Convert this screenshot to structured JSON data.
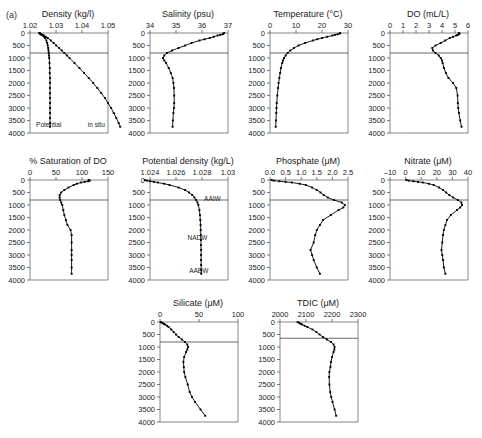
{
  "figure": {
    "panel_letter": "(a)",
    "depth_axis": {
      "label": "Depth (m)",
      "ticks": [
        0,
        500,
        1000,
        1500,
        2000,
        2500,
        3000,
        3500,
        4000
      ],
      "range": [
        0,
        4000
      ],
      "inverted": true
    },
    "reference_line_depth": 800
  },
  "chart_data": [
    {
      "type": "line",
      "title": "Density (kg/l)",
      "xlabel": "Density (kg/l)",
      "ylabel": "Depth (m)",
      "xlim": [
        1.02,
        1.05
      ],
      "ylim": [
        0,
        4000
      ],
      "xticks": [
        1.02,
        1.03,
        1.04,
        1.05
      ],
      "xticklabels": [
        "1.02",
        "1.03",
        "1.04",
        "1.05"
      ],
      "yticks": [
        0,
        500,
        1000,
        1500,
        2000,
        2500,
        3000,
        3500,
        4000
      ],
      "grid": false,
      "reference_line": 800,
      "annotations": [
        {
          "text": "Potential",
          "depth": 3750,
          "value": 1.0272
        },
        {
          "text": "in situ",
          "depth": 3750,
          "value": 1.0455
        }
      ],
      "series": [
        {
          "name": "Potential",
          "depths": [
            0,
            25,
            50,
            75,
            100,
            150,
            200,
            300,
            400,
            500,
            600,
            700,
            800,
            900,
            1000,
            1200,
            1400,
            1600,
            1800,
            2000,
            2200,
            2400,
            2600,
            2800,
            3000,
            3200,
            3400,
            3600,
            3750
          ],
          "values": [
            1.0236,
            1.0238,
            1.0241,
            1.0245,
            1.0249,
            1.0254,
            1.0258,
            1.0263,
            1.0266,
            1.0268,
            1.027,
            1.0271,
            1.0272,
            1.0273,
            1.0274,
            1.0275,
            1.0276,
            1.0276,
            1.0277,
            1.0277,
            1.0277,
            1.0277,
            1.0277,
            1.0277,
            1.0277,
            1.0277,
            1.0277,
            1.0277,
            1.0277
          ]
        },
        {
          "name": "in situ",
          "depths": [
            0,
            25,
            50,
            75,
            100,
            150,
            200,
            300,
            400,
            500,
            600,
            700,
            800,
            900,
            1000,
            1200,
            1400,
            1600,
            1800,
            2000,
            2200,
            2400,
            2600,
            2800,
            3000,
            3200,
            3400,
            3600,
            3750
          ],
          "values": [
            1.0236,
            1.0239,
            1.0243,
            1.0248,
            1.0253,
            1.0261,
            1.0268,
            1.028,
            1.0291,
            1.0301,
            1.0312,
            1.0322,
            1.0332,
            1.0342,
            1.0352,
            1.0371,
            1.039,
            1.0408,
            1.0426,
            1.0443,
            1.0459,
            1.0474,
            1.0488,
            1.05,
            1.0512,
            1.0522,
            1.0532,
            1.0541,
            1.0547
          ]
        }
      ]
    },
    {
      "type": "line",
      "title": "Salinity (psu)",
      "xlabel": "Salinity (psu)",
      "ylabel": "Depth (m)",
      "xlim": [
        34,
        37
      ],
      "ylim": [
        0,
        4000
      ],
      "xticks": [
        34,
        35,
        36,
        37
      ],
      "xticklabels": [
        "34",
        "35",
        "36",
        "37"
      ],
      "yticks": [
        0,
        500,
        1000,
        1500,
        2000,
        2500,
        3000,
        3500,
        4000
      ],
      "grid": false,
      "reference_line": 800,
      "series": [
        {
          "name": "Salinity",
          "depths": [
            0,
            25,
            50,
            75,
            100,
            150,
            200,
            250,
            300,
            400,
            500,
            600,
            700,
            800,
            900,
            1000,
            1100,
            1200,
            1400,
            1600,
            1800,
            2000,
            2200,
            2500,
            2800,
            3000,
            3200,
            3500,
            3750
          ],
          "values": [
            36.85,
            36.82,
            36.8,
            36.7,
            36.6,
            36.45,
            36.3,
            36.1,
            35.9,
            35.6,
            35.35,
            35.1,
            34.85,
            34.65,
            34.55,
            34.5,
            34.55,
            34.62,
            34.72,
            34.8,
            34.87,
            34.9,
            34.92,
            34.93,
            34.93,
            34.92,
            34.9,
            34.88,
            34.87
          ]
        }
      ]
    },
    {
      "type": "line",
      "title": "Temperature (°C)",
      "xlabel": "Temperature (°C)",
      "ylabel": "Depth (m)",
      "xlim": [
        0,
        30
      ],
      "ylim": [
        0,
        4000
      ],
      "xticks": [
        0,
        10,
        20,
        30
      ],
      "xticklabels": [
        "0",
        "10",
        "20",
        "30"
      ],
      "yticks": [
        0,
        500,
        1000,
        1500,
        2000,
        2500,
        3000,
        3500,
        4000
      ],
      "grid": false,
      "reference_line": 800,
      "series": [
        {
          "name": "Temperature",
          "depths": [
            0,
            25,
            50,
            75,
            100,
            150,
            200,
            250,
            300,
            400,
            500,
            600,
            700,
            800,
            900,
            1000,
            1100,
            1200,
            1400,
            1600,
            1800,
            2000,
            2200,
            2500,
            2800,
            3000,
            3200,
            3500,
            3750
          ],
          "values": [
            27.0,
            26.8,
            26.0,
            25.0,
            24.0,
            22.0,
            20.0,
            18.2,
            16.5,
            13.5,
            11.0,
            9.2,
            7.8,
            6.8,
            6.0,
            5.4,
            5.0,
            4.7,
            4.2,
            3.9,
            3.6,
            3.3,
            3.1,
            2.8,
            2.6,
            2.5,
            2.4,
            2.3,
            2.2
          ]
        }
      ]
    },
    {
      "type": "line",
      "title": "DO (mL/L)",
      "xlabel": "DO (mL/L)",
      "ylabel": "Depth (m)",
      "xlim": [
        0,
        6
      ],
      "ylim": [
        0,
        4000
      ],
      "xticks": [
        0,
        1,
        2,
        3,
        4,
        5,
        6
      ],
      "xticklabels": [
        "0",
        "1",
        "2",
        "3",
        "4",
        "5",
        "6"
      ],
      "yticks": [
        0,
        500,
        1000,
        1500,
        2000,
        2500,
        3000,
        3500,
        4000
      ],
      "grid": false,
      "reference_line": 800,
      "series": [
        {
          "name": "DO",
          "depths": [
            0,
            25,
            50,
            75,
            100,
            150,
            200,
            300,
            400,
            500,
            600,
            700,
            800,
            900,
            1000,
            1100,
            1200,
            1400,
            1600,
            1800,
            2000,
            2200,
            2500,
            2800,
            3000,
            3200,
            3500,
            3750
          ],
          "values": [
            5.3,
            5.35,
            5.3,
            5.2,
            5.1,
            4.85,
            4.6,
            4.25,
            3.9,
            3.5,
            3.25,
            3.3,
            3.5,
            3.75,
            3.9,
            4.0,
            4.05,
            4.15,
            4.3,
            4.5,
            4.85,
            5.1,
            5.2,
            5.22,
            5.25,
            5.3,
            5.4,
            5.5
          ]
        }
      ]
    },
    {
      "type": "line",
      "title": "% Saturation of DO",
      "xlabel": "% Saturation of DO",
      "ylabel": "Depth (m)",
      "xlim": [
        0,
        150
      ],
      "ylim": [
        0,
        4000
      ],
      "xticks": [
        0,
        50,
        100,
        150
      ],
      "xticklabels": [
        "0",
        "50",
        "100",
        "150"
      ],
      "yticks": [
        0,
        500,
        1000,
        1500,
        2000,
        2500,
        3000,
        3500,
        4000
      ],
      "grid": false,
      "reference_line": 800,
      "series": [
        {
          "name": "Saturation",
          "depths": [
            0,
            25,
            50,
            75,
            100,
            150,
            200,
            300,
            400,
            500,
            600,
            700,
            800,
            900,
            1000,
            1200,
            1400,
            1600,
            1800,
            2000,
            2200,
            2500,
            2800,
            3000,
            3200,
            3500,
            3750
          ],
          "values": [
            113,
            115,
            112,
            105,
            98,
            90,
            84,
            74,
            66,
            60,
            57,
            57,
            58,
            60,
            62,
            64,
            66,
            69,
            72,
            78,
            80,
            80,
            80,
            80,
            80,
            80,
            80
          ]
        }
      ]
    },
    {
      "type": "line",
      "title": "Potential density (kg/L)",
      "xlabel": "Potential density (kg/L)",
      "ylabel": "Depth (m)",
      "xlim": [
        1.024,
        1.03
      ],
      "ylim": [
        0,
        4000
      ],
      "xticks": [
        1.024,
        1.026,
        1.028,
        1.03
      ],
      "xticklabels": [
        "1.024",
        "1.026",
        "1.028",
        "1.03"
      ],
      "yticks": [
        0,
        500,
        1000,
        1500,
        2000,
        2500,
        3000,
        3500,
        4000
      ],
      "grid": false,
      "reference_line": 800,
      "annotations": [
        {
          "text": "AAIW",
          "depth": 850,
          "value": 1.0288
        },
        {
          "text": "NADW",
          "depth": 2400,
          "value": 1.02765
        },
        {
          "text": "AABW",
          "depth": 3700,
          "value": 1.02775
        }
      ],
      "series": [
        {
          "name": "Potential density",
          "depths": [
            0,
            25,
            50,
            75,
            100,
            150,
            200,
            300,
            400,
            500,
            600,
            700,
            800,
            900,
            1000,
            1200,
            1400,
            1600,
            1800,
            2000,
            2200,
            2400,
            2600,
            2800,
            3000,
            3200,
            3400,
            3600,
            3750
          ],
          "values": [
            1.0236,
            1.02375,
            1.024,
            1.0243,
            1.0246,
            1.0251,
            1.0255,
            1.0262,
            1.0267,
            1.027,
            1.02725,
            1.02742,
            1.02755,
            1.02765,
            1.02772,
            1.0278,
            1.02784,
            1.02787,
            1.02789,
            1.0279,
            1.02791,
            1.02792,
            1.02792,
            1.02793,
            1.02793,
            1.02793,
            1.02793,
            1.02794,
            1.02794
          ]
        }
      ]
    },
    {
      "type": "line",
      "title": "Phosphate (μM)",
      "xlabel": "Phosphate (μM)",
      "ylabel": "Depth (m)",
      "xlim": [
        0,
        2.5
      ],
      "ylim": [
        0,
        4000
      ],
      "xticks": [
        0,
        0.5,
        1.0,
        1.5,
        2.0,
        2.5
      ],
      "xticklabels": [
        "0.0",
        "0.5",
        "1.0",
        "1.5",
        "2.0",
        "2.5"
      ],
      "yticks": [
        0,
        500,
        1000,
        1500,
        2000,
        2500,
        3000,
        3500,
        4000
      ],
      "grid": false,
      "reference_line": 800,
      "series": [
        {
          "name": "Phosphate",
          "depths": [
            0,
            25,
            50,
            75,
            100,
            150,
            200,
            300,
            400,
            500,
            600,
            700,
            800,
            900,
            1000,
            1100,
            1200,
            1400,
            1600,
            1800,
            2000,
            2200,
            2500,
            2800,
            3000,
            3200,
            3500,
            3750
          ],
          "values": [
            0.05,
            0.12,
            0.3,
            0.5,
            0.7,
            0.95,
            1.15,
            1.35,
            1.5,
            1.62,
            1.72,
            1.85,
            2.05,
            2.3,
            2.4,
            2.35,
            2.2,
            1.95,
            1.7,
            1.6,
            1.5,
            1.45,
            1.4,
            1.3,
            1.35,
            1.4,
            1.5,
            1.6
          ]
        }
      ]
    },
    {
      "type": "line",
      "title": "Nitrate (μM)",
      "xlabel": "Nitrate (μM)",
      "ylabel": "Depth (m)",
      "xlim": [
        -10,
        40
      ],
      "ylim": [
        0,
        4000
      ],
      "xticks": [
        -10,
        0,
        10,
        20,
        30,
        40
      ],
      "xticklabels": [
        "–10",
        "0",
        "10",
        "20",
        "30",
        "40"
      ],
      "yticks": [
        0,
        500,
        1000,
        1500,
        2000,
        2500,
        3000,
        3500,
        4000
      ],
      "grid": false,
      "reference_line": 800,
      "series": [
        {
          "name": "Nitrate",
          "depths": [
            0,
            25,
            50,
            75,
            100,
            150,
            200,
            300,
            400,
            500,
            600,
            700,
            800,
            900,
            1000,
            1100,
            1200,
            1400,
            1600,
            1800,
            2000,
            2200,
            2500,
            2800,
            3000,
            3200,
            3500,
            3750
          ],
          "values": [
            0.5,
            2.0,
            5.0,
            8.0,
            11.0,
            15.0,
            18.0,
            21.5,
            24.0,
            26.0,
            28.0,
            30.5,
            33.5,
            35.8,
            36.2,
            35.0,
            33.0,
            29.0,
            26.5,
            25.5,
            24.5,
            24.0,
            23.5,
            23.0,
            23.5,
            24.0,
            24.5,
            25.5
          ]
        }
      ]
    },
    {
      "type": "line",
      "title": "Silicate (μM)",
      "xlabel": "Silicate (μM)",
      "ylabel": "Depth (m)",
      "xlim": [
        0,
        100
      ],
      "ylim": [
        0,
        4000
      ],
      "xticks": [
        0,
        50,
        100
      ],
      "xticklabels": [
        "0",
        "50",
        "100"
      ],
      "yticks": [
        0,
        500,
        1000,
        1500,
        2000,
        2500,
        3000,
        3500,
        4000
      ],
      "grid": false,
      "reference_line": 800,
      "series": [
        {
          "name": "Silicate",
          "depths": [
            0,
            25,
            50,
            75,
            100,
            150,
            200,
            300,
            400,
            500,
            600,
            700,
            800,
            900,
            1000,
            1100,
            1200,
            1400,
            1600,
            1800,
            2000,
            2200,
            2500,
            2800,
            3000,
            3200,
            3500,
            3750
          ],
          "values": [
            1.0,
            2.0,
            3.5,
            5.0,
            6.5,
            9.0,
            11.0,
            14.5,
            17.5,
            20.5,
            24.0,
            28.0,
            32.0,
            35.0,
            36.0,
            35.0,
            33.5,
            31.0,
            30.0,
            30.5,
            31.0,
            32.5,
            35.5,
            38.0,
            41.0,
            45.0,
            52.0,
            58.0
          ]
        }
      ]
    },
    {
      "type": "line",
      "title": "TDIC (μM)",
      "xlabel": "TDIC (μM)",
      "ylabel": "Depth (m)",
      "xlim": [
        2000,
        2300
      ],
      "ylim": [
        0,
        4000
      ],
      "xticks": [
        2000,
        2100,
        2200,
        2300
      ],
      "xticklabels": [
        "2000",
        "2100",
        "2200",
        "2300"
      ],
      "yticks": [
        0,
        500,
        1000,
        1500,
        2000,
        2500,
        3000,
        3500,
        4000
      ],
      "grid": false,
      "reference_line": 650,
      "series": [
        {
          "name": "TDIC",
          "depths": [
            0,
            25,
            50,
            75,
            100,
            150,
            200,
            300,
            400,
            500,
            600,
            700,
            800,
            900,
            1000,
            1100,
            1200,
            1400,
            1600,
            1800,
            2000,
            2200,
            2500,
            2800,
            3000,
            3200,
            3500,
            3750
          ],
          "values": [
            2068,
            2072,
            2076,
            2080,
            2085,
            2095,
            2105,
            2125,
            2140,
            2152,
            2165,
            2180,
            2196,
            2206,
            2210,
            2209,
            2206,
            2200,
            2196,
            2194,
            2190,
            2189,
            2190,
            2193,
            2197,
            2202,
            2210,
            2216
          ]
        }
      ]
    }
  ]
}
